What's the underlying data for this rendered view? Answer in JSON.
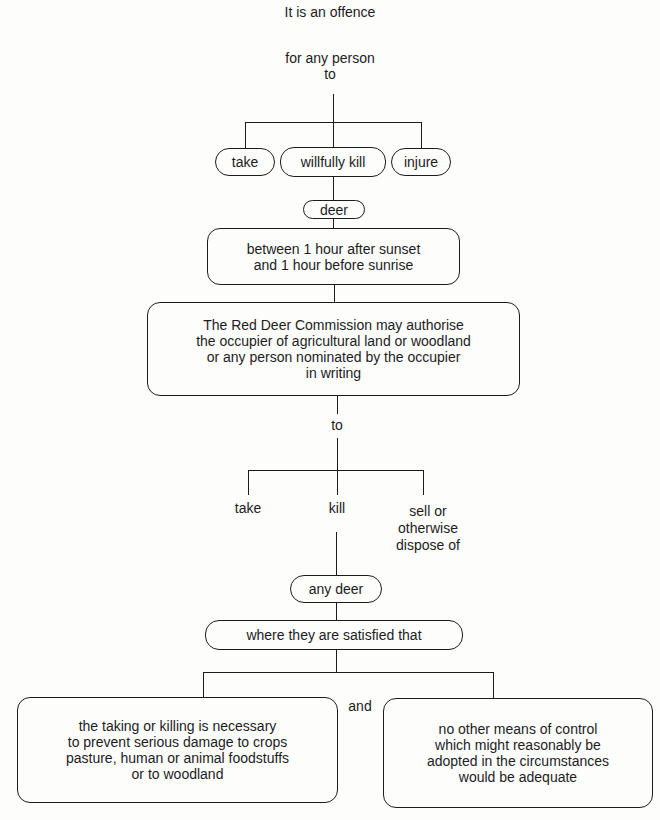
{
  "diagram": {
    "header": {
      "line1": "It is an offence",
      "line2": "for any person",
      "line3": "to"
    },
    "offence_actions": [
      "take",
      "willfully kill",
      "injure"
    ],
    "object": "deer",
    "time_condition": "between 1 hour after sunset\nand 1 hour before sunrise",
    "exception": "The Red Deer Commission may authorise\nthe occupier of agricultural land or woodland\nor any person nominated by the occupier\nin writing",
    "exception_connector": "to",
    "permitted_actions": [
      "take",
      "kill",
      "sell or\notherwise\ndispose of"
    ],
    "permitted_object": "any deer",
    "condition_intro": "where they are satisfied that",
    "conditions": [
      "the taking or killing is necessary\nto prevent serious damage to crops\npasture, human or animal foodstuffs\nor to woodland",
      "no other means of control\nwhich might reasonably be\nadopted in the circumstances\nwould be adequate"
    ],
    "conditions_connector": "and",
    "colors": {
      "ink": "#1c1c1c",
      "paper": "#fdfdfc"
    }
  }
}
